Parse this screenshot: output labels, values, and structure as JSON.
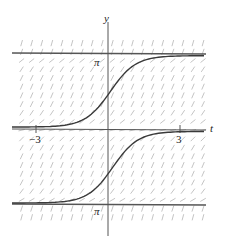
{
  "chart_data": {
    "type": "line",
    "subtype": "slope_field_with_solution_curves",
    "title": "",
    "xlabel": "t",
    "ylabel": "y",
    "xlim": [
      -3.6,
      4.0
    ],
    "ylim": [
      -3.9,
      3.6
    ],
    "x_ticks": [
      {
        "value": -3,
        "label": "−3"
      },
      {
        "value": 3,
        "label": "3"
      }
    ],
    "y_ticks": [
      {
        "value": 3.14159,
        "label": "π"
      },
      {
        "value": -3.14159,
        "label": "π"
      }
    ],
    "equilibrium_lines": [
      3.14159,
      -3.14159
    ],
    "grid": false,
    "slope_field": {
      "description": "dy/dt ≈ f(y) with slopes near zero at y = 0 and y = ±π, steep between them and steep beyond ±π",
      "color": "#b8b8b8"
    },
    "series": [
      {
        "name": "solution-upper",
        "description": "rises from near 0 (t → −∞) to π (t → +∞)",
        "y_start": 0.15,
        "y_end": 3.0,
        "y_at_t0": 1.2
      },
      {
        "name": "solution-lower",
        "description": "rises from near −π (t → −∞) to near 0 (t → +∞)",
        "y_start": -3.0,
        "y_end": -0.15,
        "y_at_t0": -1.0
      }
    ],
    "legend": null
  },
  "labels": {
    "y_axis": "y",
    "t_axis": "t",
    "pi_upper": "π",
    "pi_lower": "π",
    "tick_neg3": "−3",
    "tick_3": "3"
  },
  "colors": {
    "curve": "#3a3a3a",
    "axis": "#555555",
    "field": "#bdbdbd"
  }
}
